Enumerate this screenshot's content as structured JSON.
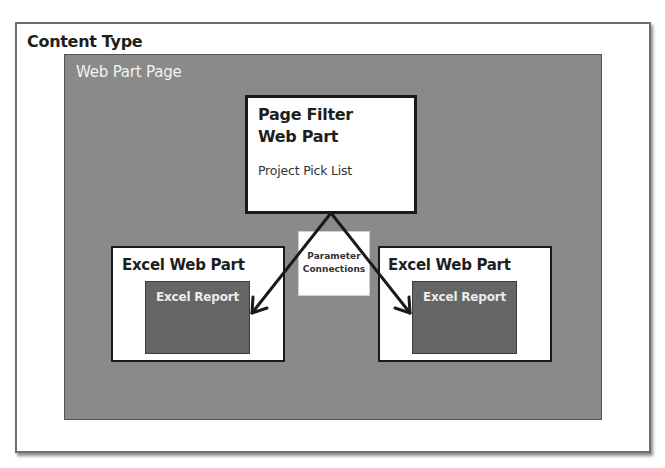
{
  "diagram": {
    "container": {
      "label": "Content Type"
    },
    "page": {
      "label": "Web Part Page"
    },
    "filter_web_part": {
      "title_line1": "Page Filter",
      "title_line2": "Web Part",
      "subtitle": "Project Pick List"
    },
    "connection": {
      "line1": "Parameter",
      "line2": "Connections"
    },
    "excel_web_parts": [
      {
        "label": "Excel Web Part",
        "report": "Excel Report"
      },
      {
        "label": "Excel Web Part",
        "report": "Excel Report"
      }
    ]
  },
  "colors": {
    "page_bg": "#8a8a8a",
    "report_bg": "#656565",
    "box_border": "#1a1a1a",
    "arrow": "#1a1a1a"
  }
}
